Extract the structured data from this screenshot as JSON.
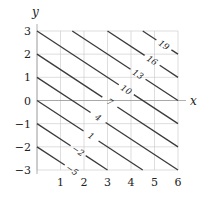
{
  "chart_data": {
    "type": "contour",
    "function": "f(x,y) = 2x + 3y + 1",
    "title": "",
    "xlabel": "x",
    "ylabel": "y",
    "xlim": [
      0,
      6
    ],
    "ylim": [
      -3,
      3
    ],
    "grid": true,
    "xticks": [
      1,
      2,
      3,
      4,
      5,
      6
    ],
    "xtick_labels": [
      "1",
      "2",
      "3",
      "4",
      "5",
      "6"
    ],
    "yticks": [
      -3,
      -2,
      -1,
      0,
      1,
      2,
      3
    ],
    "ytick_labels": [
      "−3",
      "−2",
      "−1",
      "0",
      "1",
      "2",
      "3"
    ],
    "coefficients": {
      "a": 2,
      "b": 3,
      "c": 1
    },
    "levels": [
      -5,
      -2,
      1,
      4,
      7,
      10,
      13,
      16,
      19
    ],
    "level_labels": [
      "−5",
      "−2",
      "1",
      "4",
      "7",
      "10",
      "13",
      "16",
      "19"
    ],
    "label_x": [
      1.5,
      1.75,
      2.3,
      2.6,
      3.1,
      3.8,
      4.3,
      4.9,
      5.4
    ]
  }
}
